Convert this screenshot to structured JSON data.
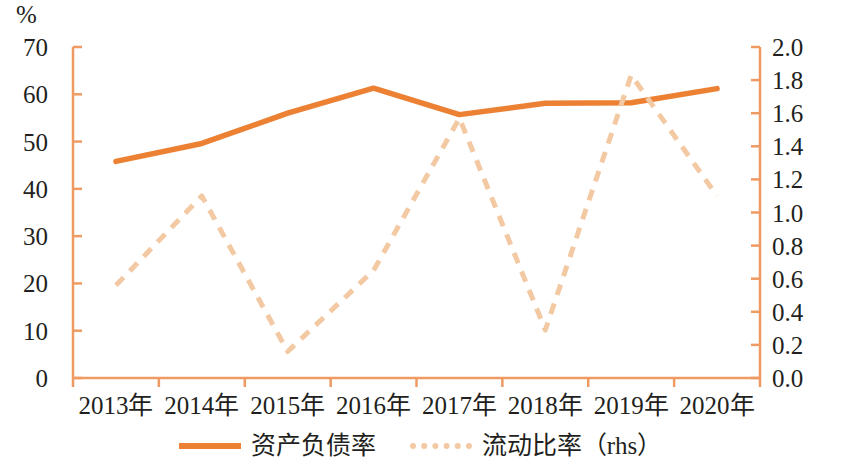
{
  "chart_data": {
    "type": "line",
    "title": "",
    "xlabel": "",
    "ylabel": "%",
    "y2label": "",
    "categories": [
      "2013年",
      "2014年",
      "2015年",
      "2016年",
      "2017年",
      "2018年",
      "2019年",
      "2020年"
    ],
    "ylim": [
      0,
      70
    ],
    "y2lim": [
      0.0,
      2.0
    ],
    "yticks": [
      "0",
      "10",
      "20",
      "30",
      "40",
      "50",
      "60",
      "70"
    ],
    "y2ticks": [
      "0.0",
      "0.2",
      "0.4",
      "0.6",
      "0.8",
      "1.0",
      "1.2",
      "1.4",
      "1.6",
      "1.8",
      "2.0"
    ],
    "grid": false,
    "legend_position": "bottom",
    "series": [
      {
        "name": "资产负债率",
        "axis": "left",
        "style": "solid",
        "color": "#ec8033",
        "values": [
          45.8,
          49.6,
          56.0,
          61.3,
          55.7,
          58.1,
          58.2,
          61.2
        ]
      },
      {
        "name": "流动比率（rhs）",
        "axis": "right",
        "style": "dashed",
        "color": "#f3c9a3",
        "values": [
          0.56,
          1.1,
          0.16,
          0.65,
          1.57,
          0.29,
          1.83,
          1.1
        ]
      }
    ]
  },
  "axes": {
    "left_unit": "%",
    "axis_color": "#ef9a63"
  },
  "legend": {
    "items": [
      {
        "label": "资产负债率",
        "style": "solid",
        "color": "#ec8033"
      },
      {
        "label": "流动比率（rhs）",
        "style": "dashed",
        "color": "#f3c9a3"
      }
    ]
  }
}
